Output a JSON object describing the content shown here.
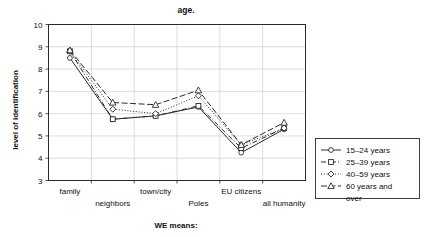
{
  "chart_data": {
    "type": "line",
    "title": "age.",
    "xlabel": "WE means:",
    "ylabel": "level of identification",
    "categories": [
      "family",
      "neighbors",
      "town/city",
      "Poles",
      "EU citizens",
      "all humanity"
    ],
    "ylim": [
      3,
      10
    ],
    "yticks": [
      3,
      4,
      5,
      6,
      7,
      8,
      9,
      10
    ],
    "grid": true,
    "legend_position": "right",
    "series": [
      {
        "name": "15–24 years",
        "marker": "circle",
        "linestyle": "solid",
        "values": [
          8.5,
          5.75,
          5.9,
          6.3,
          4.25,
          5.3
        ]
      },
      {
        "name": "25–39 years",
        "marker": "square",
        "linestyle": "dashdot",
        "values": [
          8.8,
          5.75,
          5.9,
          6.35,
          4.45,
          5.35
        ]
      },
      {
        "name": "40–59 years",
        "marker": "diamond",
        "linestyle": "dotted",
        "values": [
          8.8,
          6.2,
          6.0,
          6.8,
          4.6,
          5.35
        ]
      },
      {
        "name": "60 years and over",
        "marker": "triangle",
        "linestyle": "dashed",
        "values": [
          8.85,
          6.5,
          6.4,
          7.05,
          4.6,
          5.6
        ]
      }
    ]
  },
  "legend": {
    "entries": [
      {
        "label": "15–24 years"
      },
      {
        "label": "25–39 years"
      },
      {
        "label": "40–59 years"
      },
      {
        "label": "60 years and"
      },
      {
        "label": "over"
      }
    ]
  }
}
